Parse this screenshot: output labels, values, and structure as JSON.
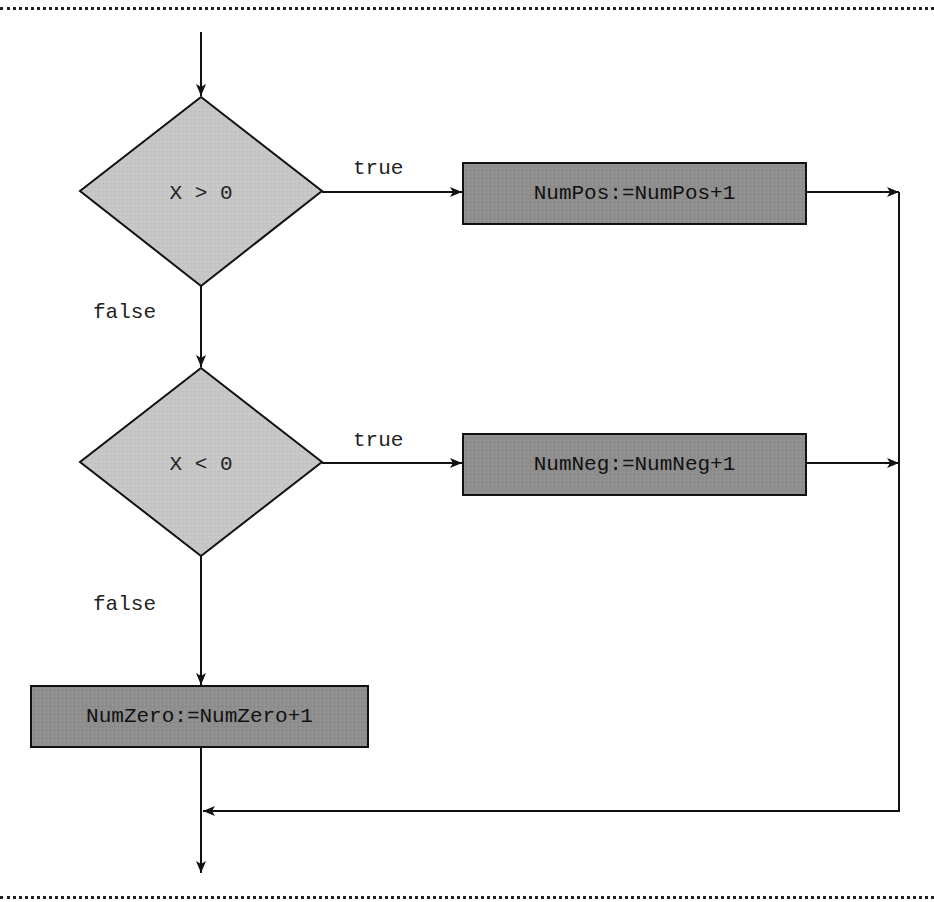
{
  "diagram": {
    "type": "flowchart",
    "colors": {
      "decision_fill": "#c6c6c6",
      "process_fill": "#8e8e8e",
      "stroke": "#222222",
      "background": "#ffffff"
    },
    "decisions": [
      {
        "id": "d1",
        "label": "X > 0"
      },
      {
        "id": "d2",
        "label": "X < 0"
      }
    ],
    "processes": [
      {
        "id": "p1",
        "label": "NumPos:=NumPos+1"
      },
      {
        "id": "p2",
        "label": "NumNeg:=NumNeg+1"
      },
      {
        "id": "p3",
        "label": "NumZero:=NumZero+1"
      }
    ],
    "edge_labels": {
      "d1_true": "true",
      "d1_false": "false",
      "d2_true": "true",
      "d2_false": "false"
    },
    "edges": [
      {
        "from": "start",
        "to": "d1"
      },
      {
        "from": "d1",
        "to": "p1",
        "label": "true"
      },
      {
        "from": "d1",
        "to": "d2",
        "label": "false"
      },
      {
        "from": "d2",
        "to": "p2",
        "label": "true"
      },
      {
        "from": "d2",
        "to": "p3",
        "label": "false"
      },
      {
        "from": "p1",
        "to": "merge"
      },
      {
        "from": "p2",
        "to": "merge"
      },
      {
        "from": "p3",
        "to": "merge"
      },
      {
        "from": "merge",
        "to": "end"
      }
    ]
  }
}
